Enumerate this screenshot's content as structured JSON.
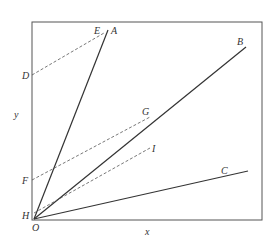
{
  "header_text": "",
  "axes": {
    "x_label": "x",
    "y_label": "y",
    "origin_label": "O"
  },
  "lines": [
    {
      "name": "A",
      "label": "A"
    },
    {
      "name": "B",
      "label": "B"
    },
    {
      "name": "C",
      "label": "C"
    }
  ],
  "points": {
    "D": "D",
    "E": "E",
    "F": "F",
    "G": "G",
    "H": "H",
    "I": "I"
  },
  "colors": {
    "line": "#333333",
    "box": "#555555"
  }
}
